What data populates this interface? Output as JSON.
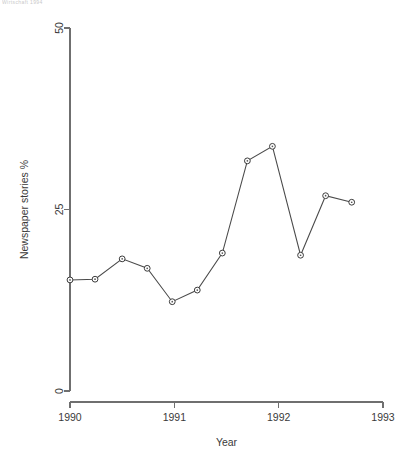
{
  "figure": {
    "top_artifact_text": "Wirtschaft 1994",
    "background": "#ffffff",
    "line_color": "#4a4a4a",
    "axis_color": "#6f6f6f",
    "text_color": "#3a3a3a"
  },
  "chart_data": {
    "type": "line",
    "title": "",
    "xlabel": "Year",
    "ylabel": "Newspaper stories %",
    "xlim": [
      1990,
      1993
    ],
    "ylim": [
      0,
      50
    ],
    "xticks": [
      1990,
      1991,
      1992,
      1993
    ],
    "xticklabels": [
      "1990",
      "1991",
      "1992",
      "1993"
    ],
    "yticks": [
      0,
      25,
      50
    ],
    "yticklabels": [
      "0",
      "25",
      "50"
    ],
    "grid": false,
    "legend": null,
    "marker": "open-circle",
    "series": [
      {
        "name": "Newspaper stories %",
        "x": [
          1990.0,
          1990.24,
          1990.5,
          1990.74,
          1990.98,
          1991.22,
          1991.46,
          1991.7,
          1991.94,
          1992.21,
          1992.45,
          1992.7
        ],
        "values": [
          15.3,
          15.4,
          18.2,
          16.9,
          12.3,
          13.9,
          19.0,
          31.7,
          33.7,
          18.7,
          26.9,
          26.0
        ]
      }
    ]
  }
}
